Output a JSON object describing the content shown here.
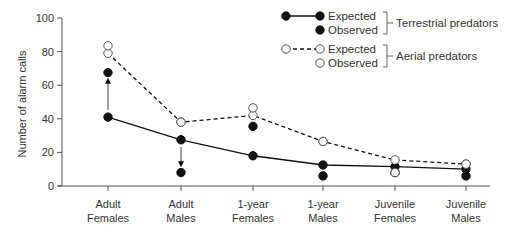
{
  "chart_data": {
    "type": "line",
    "title": "",
    "xlabel": "",
    "ylabel": "Number of alarm calls",
    "ylim": [
      0,
      100
    ],
    "yticks": [
      0,
      20,
      40,
      60,
      80,
      100
    ],
    "grid": false,
    "legend_position": "top-right",
    "categories": [
      [
        "Adult",
        "Females"
      ],
      [
        "Adult",
        "Males"
      ],
      [
        "1-year",
        "Females"
      ],
      [
        "1-year",
        "Males"
      ],
      [
        "Juvenile",
        "Females"
      ],
      [
        "Juvenile",
        "Males"
      ]
    ],
    "series": [
      {
        "name": "Terrestrial predators - Expected",
        "group": "terrestrial",
        "kind": "expected",
        "marker": "filled",
        "line": "solid",
        "values": [
          41,
          27.5,
          18,
          12.5,
          11.5,
          10
        ]
      },
      {
        "name": "Terrestrial predators - Observed",
        "group": "terrestrial",
        "kind": "observed",
        "marker": "filled",
        "line": "none",
        "values": [
          67.5,
          8,
          35.5,
          6,
          8,
          6
        ]
      },
      {
        "name": "Aerial predators - Expected",
        "group": "aerial",
        "kind": "expected",
        "marker": "open",
        "line": "dashed",
        "values": [
          79,
          38,
          42,
          26.5,
          15.5,
          13
        ]
      },
      {
        "name": "Aerial predators - Observed",
        "group": "aerial",
        "kind": "observed",
        "marker": "open",
        "line": "none",
        "values": [
          83.5,
          38,
          46.5,
          26.5,
          8,
          13
        ]
      }
    ],
    "annotations": [
      {
        "type": "arrow",
        "category": 0,
        "from": 41,
        "to": 67.5,
        "series": "terrestrial"
      },
      {
        "type": "arrow",
        "category": 1,
        "from": 27.5,
        "to": 8,
        "series": "terrestrial"
      }
    ],
    "legend": {
      "entries": [
        {
          "label": "Expected",
          "group": "terrestrial",
          "marker": "filled",
          "line": "solid"
        },
        {
          "label": "Observed",
          "group": "terrestrial",
          "marker": "filled",
          "line": "none"
        },
        {
          "label": "Expected",
          "group": "aerial",
          "marker": "open",
          "line": "dashed"
        },
        {
          "label": "Observed",
          "group": "aerial",
          "marker": "open",
          "line": "none"
        }
      ],
      "groups": [
        {
          "id": "terrestrial",
          "label": "Terrestrial predators"
        },
        {
          "id": "aerial",
          "label": "Aerial predators"
        }
      ]
    }
  },
  "colors": {
    "ink": "#111111",
    "axis": "#555555",
    "text": "#333333"
  }
}
